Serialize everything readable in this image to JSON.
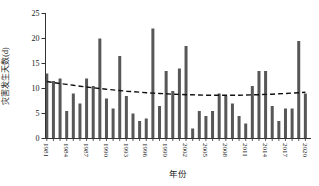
{
  "chart_data": {
    "type": "bar",
    "title": "",
    "xlabel": "年份",
    "ylabel": "灾害发生天数(d)",
    "ylim": [
      0,
      25
    ],
    "y_ticks": [
      0,
      5,
      10,
      15,
      20,
      25
    ],
    "grid": false,
    "legend": "none",
    "bar_color": "#575757",
    "axis_color": "#333333",
    "x": [
      1981,
      1982,
      1983,
      1984,
      1985,
      1986,
      1987,
      1988,
      1989,
      1990,
      1991,
      1992,
      1993,
      1994,
      1995,
      1996,
      1997,
      1998,
      1999,
      2000,
      2001,
      2002,
      2003,
      2004,
      2005,
      2006,
      2007,
      2008,
      2009,
      2010,
      2011,
      2012,
      2013,
      2014,
      2015,
      2016,
      2017,
      2018,
      2019,
      2020
    ],
    "values": [
      13,
      11.5,
      12,
      5.5,
      9,
      7,
      12,
      10.5,
      20,
      8,
      6,
      16.5,
      8.5,
      5,
      3.5,
      4,
      22,
      6.5,
      13.5,
      9.5,
      14,
      18.5,
      2,
      5.5,
      4.5,
      5.5,
      9,
      8.5,
      7,
      4.5,
      3,
      10.5,
      13.5,
      13.5,
      6.5,
      3.5,
      6,
      6,
      19.5,
      9
    ],
    "x_tick_labels": [
      "1981",
      "1984",
      "1987",
      "1990",
      "1993",
      "1996",
      "1999",
      "2002",
      "2005",
      "2008",
      "2011",
      "2014",
      "2017",
      "2020"
    ],
    "trend": {
      "name": "dashed-trend-line",
      "style": "dashed",
      "color": "#111111",
      "values": [
        11.4,
        11.2,
        11.0,
        10.81,
        10.63,
        10.46,
        10.3,
        10.14,
        9.99,
        9.85,
        9.72,
        9.59,
        9.47,
        9.36,
        9.26,
        9.17,
        9.08,
        9.0,
        8.93,
        8.87,
        8.82,
        8.77,
        8.73,
        8.7,
        8.67,
        8.66,
        8.65,
        8.65,
        8.66,
        8.67,
        8.7,
        8.73,
        8.77,
        8.82,
        8.87,
        8.93,
        9.0,
        9.08,
        9.17,
        9.26
      ]
    }
  }
}
